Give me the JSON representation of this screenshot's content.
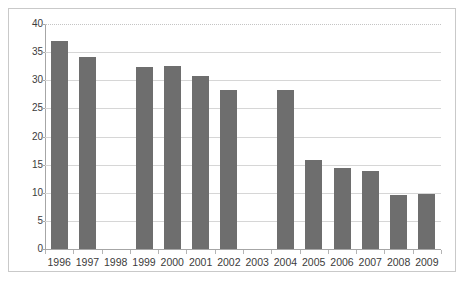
{
  "chart_data": {
    "type": "bar",
    "title": "",
    "subtitle": "",
    "xlabel": "",
    "ylabel": "",
    "categories": [
      "1996",
      "1997",
      "1998",
      "1999",
      "2000",
      "2001",
      "2002",
      "2003",
      "2004",
      "2005",
      "2006",
      "2007",
      "2008",
      "2009"
    ],
    "values": [
      36.9,
      34.2,
      null,
      32.3,
      32.5,
      30.7,
      28.2,
      null,
      28.2,
      15.9,
      14.4,
      13.9,
      9.6,
      9.8
    ],
    "series": [
      {
        "name": "",
        "values": [
          36.9,
          34.2,
          null,
          32.3,
          32.5,
          30.7,
          28.2,
          null,
          28.2,
          15.9,
          14.4,
          13.9,
          9.6,
          9.8
        ]
      }
    ],
    "ylim": [
      0,
      40
    ],
    "y_ticks": [
      0,
      5,
      10,
      15,
      20,
      25,
      30,
      35,
      40
    ],
    "y_tick_labels": [
      "0",
      "5",
      "10",
      "15",
      "20",
      "25",
      "30",
      "35",
      "40"
    ],
    "grid": true,
    "grid_axis": "y",
    "legend": false,
    "legend_position": "none",
    "bar_color": "#6e6e6e",
    "gridline_color": "#d6d6d6",
    "axis_color": "#a6a6a6",
    "border_color": "#c9c9c9",
    "background_color": "#ffffff",
    "text_color": "#3b3b3b",
    "missing_categories": [
      "1998",
      "2003"
    ],
    "annotations": []
  }
}
